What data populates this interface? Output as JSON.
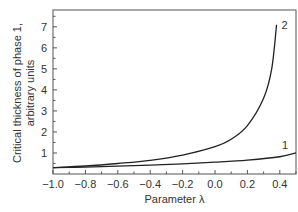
{
  "chart_data": {
    "type": "line",
    "title": "",
    "xlabel": "Parameter λ",
    "ylabel_line1": "Critical thickness of phase 1,",
    "ylabel_line2": "arbitrary units",
    "xlim": [
      -1.0,
      0.5
    ],
    "ylim": [
      0,
      7.8
    ],
    "x_ticks": [
      "-1.0",
      "-0.8",
      "-0.6",
      "-0.4",
      "-0.2",
      "0.0",
      "0.2",
      "0.4"
    ],
    "y_ticks": [
      "1",
      "2",
      "3",
      "4",
      "5",
      "6",
      "7"
    ],
    "grid": false,
    "legend": "inline curve labels",
    "series": [
      {
        "name": "1",
        "x": [
          -1.0,
          -0.8,
          -0.6,
          -0.4,
          -0.2,
          0.0,
          0.2,
          0.4,
          0.5
        ],
        "y": [
          0.3,
          0.33,
          0.37,
          0.42,
          0.48,
          0.56,
          0.66,
          0.82,
          1.0
        ]
      },
      {
        "name": "2",
        "x": [
          -1.0,
          -0.8,
          -0.6,
          -0.4,
          -0.2,
          0.0,
          0.1,
          0.2,
          0.3,
          0.35,
          0.38
        ],
        "y": [
          0.3,
          0.38,
          0.5,
          0.65,
          0.9,
          1.3,
          1.65,
          2.3,
          3.6,
          5.0,
          7.1
        ]
      }
    ]
  }
}
